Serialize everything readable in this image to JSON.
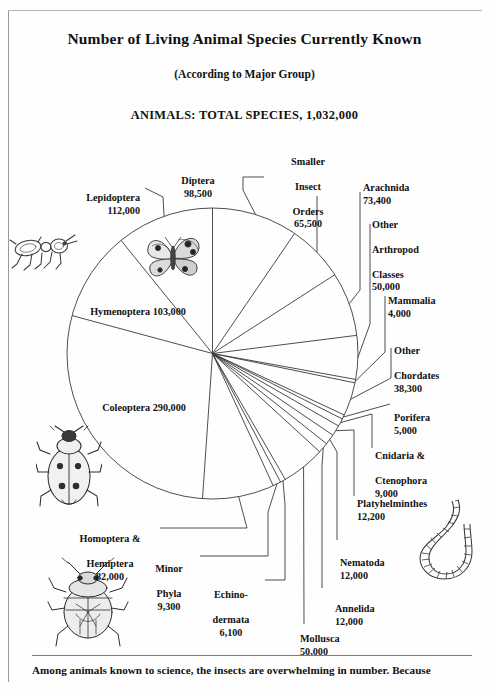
{
  "figure": {
    "title": "Number of Living Animal Species Currently Known",
    "subtitle": "(According to Major Group)",
    "total_line": "ANIMALS: TOTAL SPECIES, 1,032,000",
    "footer_text": "Among animals known to science, the insects are overwhelming in number. Because"
  },
  "chart_data": {
    "type": "pie",
    "title": "Number of Living Animal Species Currently Known",
    "subtitle": "(According to Major Group)",
    "total_label": "ANIMALS: TOTAL SPECIES, 1,032,000",
    "total": 1032000,
    "units": "species",
    "legend": "none",
    "grid": false,
    "start_angle_deg": -90,
    "direction": "clockwise",
    "categories": [
      "Diptera",
      "Smaller Insect Orders",
      "Arachnida",
      "Other Arthropod Classes",
      "Mammalia",
      "Other Chordates",
      "Porifera",
      "Cnidaria & Ctenophora",
      "Platyhelminthes",
      "Nematoda",
      "Annelida",
      "Mollusca",
      "Echinodermata",
      "Minor Phyla",
      "Homoptera & Hemiptera",
      "Coleoptera",
      "Hymenoptera",
      "Lepidoptera"
    ],
    "values": [
      98500,
      65500,
      73400,
      50000,
      4000,
      38300,
      5000,
      9000,
      12200,
      12000,
      12000,
      50000,
      6100,
      9300,
      82000,
      290000,
      103000,
      112000
    ],
    "slices": [
      {
        "name": "Diptera",
        "value": 98500,
        "value_label": "98,500",
        "label": "Diptera\n98,500"
      },
      {
        "name": "Smaller Insect Orders",
        "value": 65500,
        "value_label": "65,500",
        "label": "Smaller\nInsect\nOrders\n65,500"
      },
      {
        "name": "Arachnida",
        "value": 73400,
        "value_label": "73,400",
        "label": "Arachnida\n73,400"
      },
      {
        "name": "Other Arthropod Classes",
        "value": 50000,
        "value_label": "50,000",
        "label": "Other\nArthropod\nClasses\n50,000"
      },
      {
        "name": "Mammalia",
        "value": 4000,
        "value_label": "4,000",
        "label": "Mammalia\n4,000"
      },
      {
        "name": "Other Chordates",
        "value": 38300,
        "value_label": "38,300",
        "label": "Other\nChordates\n38,300"
      },
      {
        "name": "Porifera",
        "value": 5000,
        "value_label": "5,000",
        "label": "Porifera\n5,000"
      },
      {
        "name": "Cnidaria & Ctenophora",
        "value": 9000,
        "value_label": "9,000",
        "label": "Cnidaria &\nCtenophora\n9,000"
      },
      {
        "name": "Platyhelminthes",
        "value": 12200,
        "value_label": "12,200",
        "label": "Platyhelminthes\n12,200"
      },
      {
        "name": "Nematoda",
        "value": 12000,
        "value_label": "12,000",
        "label": "Nematoda\n12,000"
      },
      {
        "name": "Annelida",
        "value": 12000,
        "value_label": "12,000",
        "label": "Annelida\n12,000"
      },
      {
        "name": "Mollusca",
        "value": 50000,
        "value_label": "50,000",
        "label": "Mollusca\n50,000"
      },
      {
        "name": "Echinodermata",
        "value": 6100,
        "value_label": "6,100",
        "label": "Echino-\ndermata\n6,100"
      },
      {
        "name": "Minor Phyla",
        "value": 9300,
        "value_label": "9,300",
        "label": "Minor\nPhyla\n9,300"
      },
      {
        "name": "Homoptera & Hemiptera",
        "value": 82000,
        "value_label": "82,000",
        "label": "Homoptera &\nHemiptera\n82,000"
      },
      {
        "name": "Coleoptera",
        "value": 290000,
        "value_label": "290,000",
        "label": "Coleoptera\n290,000"
      },
      {
        "name": "Hymenoptera",
        "value": 103000,
        "value_label": "103,000",
        "label": "Hymenoptera\n103,000"
      },
      {
        "name": "Lepidoptera",
        "value": 112000,
        "value_label": "112,000",
        "label": "Lepidoptera\n112,000"
      }
    ]
  },
  "labels": {
    "lepidoptera": {
      "name": "Lepidoptera",
      "value": "112,000"
    },
    "diptera": {
      "name": "Diptera",
      "value": "98,500"
    },
    "smaller": {
      "l1": "Smaller",
      "l2": "Insect",
      "l3": "Orders",
      "value": "65,500"
    },
    "arachnida": {
      "name": "Arachnida",
      "value": "73,400"
    },
    "otherarth": {
      "l1": "Other",
      "l2": "Arthropod",
      "l3": "Classes",
      "value": "50,000"
    },
    "mammalia": {
      "name": "Mammalia",
      "value": "4,000"
    },
    "otherchord": {
      "l1": "Other",
      "l2": "Chordates",
      "value": "38,300"
    },
    "porifera": {
      "name": "Porifera",
      "value": "5,000"
    },
    "cnidaria": {
      "l1": "Cnidaria &",
      "l2": "Ctenophora",
      "value": "9,000"
    },
    "platy": {
      "name": "Platyhelminthes",
      "value": "12,200"
    },
    "nematoda": {
      "name": "Nematoda",
      "value": "12,000"
    },
    "annelida": {
      "name": "Annelida",
      "value": "12,000"
    },
    "mollusca": {
      "name": "Mollusca",
      "value": "50,000"
    },
    "echino": {
      "l1": "Echino-",
      "l2": "dermata",
      "value": "6,100"
    },
    "minorphyla": {
      "l1": "Minor",
      "l2": "Phyla",
      "value": "9,300"
    },
    "homoptera": {
      "l1": "Homoptera &",
      "l2": "Hemiptera",
      "value": "82,000"
    },
    "coleoptera": {
      "name": "Coleoptera",
      "value": "290,000"
    },
    "hymenoptera": {
      "name": "Hymenoptera",
      "value": "103,000"
    }
  },
  "illustrations": [
    {
      "id": "ant-illustration",
      "name": "ant"
    },
    {
      "id": "butterfly-illustration",
      "name": "butterfly"
    },
    {
      "id": "beetle-illustration",
      "name": "ladybird-beetle"
    },
    {
      "id": "truebug-illustration",
      "name": "shield-bug"
    },
    {
      "id": "worm-illustration",
      "name": "segmented-worm"
    }
  ],
  "colors": {
    "ink": "#111111",
    "line": "#3a3a3a",
    "paper": "#fefefe",
    "rule": "#7d7d7d"
  }
}
